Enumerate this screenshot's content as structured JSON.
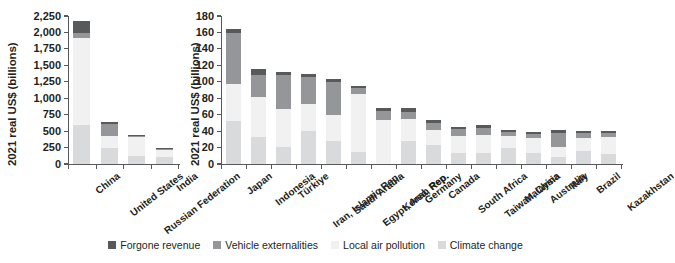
{
  "figure": {
    "background_color": "#ffffff",
    "text_color": "#231f20",
    "axis_color": "#58595b"
  },
  "legend": {
    "position": "bottom-center",
    "items": [
      {
        "key": "forgone",
        "label": "Forgone revenue",
        "color": "#58595b"
      },
      {
        "key": "vehicle",
        "label": "Vehicle externalities",
        "color": "#949699"
      },
      {
        "key": "localair",
        "label": "Local air pollution",
        "color": "#f1f1f1"
      },
      {
        "key": "climate",
        "label": "Climate change",
        "color": "#d9dadb"
      }
    ]
  },
  "chart_data": [
    {
      "id": "left-panel",
      "type": "bar",
      "stacked": true,
      "title": "",
      "xlabel": "",
      "ylabel": "2021 real US$ (billions)",
      "ylim": [
        0,
        2250
      ],
      "yticks": [
        0,
        250,
        500,
        750,
        1000,
        1250,
        1500,
        1750,
        2000,
        2250
      ],
      "ytick_labels": [
        "0",
        "250",
        "500",
        "750",
        "1,000",
        "1,250",
        "1,500",
        "1,750",
        "2,000",
        "2,250"
      ],
      "grid": false,
      "categories": [
        "China",
        "United States",
        "Russian Federation",
        "India"
      ],
      "series": [
        {
          "name": "Climate change",
          "key": "climate",
          "color": "#d9dadb",
          "values": [
            600,
            240,
            120,
            110
          ]
        },
        {
          "name": "Local air pollution",
          "key": "localair",
          "color": "#f1f1f1",
          "values": [
            1310,
            180,
            285,
            110
          ]
        },
        {
          "name": "Vehicle externalities",
          "key": "vehicle",
          "color": "#949699",
          "values": [
            75,
            190,
            15,
            10
          ]
        },
        {
          "name": "Forgone revenue",
          "key": "forgone",
          "color": "#58595b",
          "values": [
            195,
            30,
            20,
            10
          ]
        }
      ],
      "totals": [
        2180,
        640,
        440,
        240
      ]
    },
    {
      "id": "right-panel",
      "type": "bar",
      "stacked": true,
      "title": "",
      "xlabel": "",
      "ylabel": "2021 real US$ (billions)",
      "ylim": [
        0,
        180
      ],
      "yticks": [
        0,
        20,
        40,
        60,
        80,
        100,
        120,
        140,
        160,
        180
      ],
      "ytick_labels": [
        "0",
        "20",
        "40",
        "60",
        "80",
        "100",
        "120",
        "140",
        "160",
        "180"
      ],
      "grid": false,
      "categories": [
        "Japan",
        "Indonesia",
        "Türkiye",
        "Iran, Islamic Rep.",
        "Saudi Arabia",
        "Egypt, Arab Rep.",
        "Korea, Rep.",
        "Germany",
        "Canada",
        "South Africa",
        "Taiwan, China",
        "Malaysia",
        "Australia",
        "Italy",
        "Brazil",
        "Kazakhstan"
      ],
      "series": [
        {
          "name": "Climate change",
          "key": "climate",
          "color": "#d9dadb",
          "values": [
            52,
            33,
            21,
            40,
            28,
            15,
            0,
            28,
            23,
            14,
            14,
            20,
            14,
            9,
            16,
            12
          ]
        },
        {
          "name": "Local air pollution",
          "key": "localair",
          "color": "#f1f1f1",
          "values": [
            45,
            48,
            46,
            33,
            32,
            70,
            54,
            27,
            18,
            20,
            21,
            14,
            18,
            12,
            16,
            21
          ]
        },
        {
          "name": "Vehicle externalities",
          "key": "vehicle",
          "color": "#949699",
          "values": [
            62,
            27,
            41,
            33,
            40,
            8,
            10,
            8,
            9,
            8,
            9,
            5,
            5,
            17,
            6,
            5
          ]
        },
        {
          "name": "Forgone revenue",
          "key": "forgone",
          "color": "#58595b",
          "values": [
            5,
            7,
            4,
            4,
            4,
            2,
            4,
            5,
            4,
            3,
            3,
            2,
            2,
            3,
            2,
            2
          ]
        }
      ],
      "totals": [
        164,
        115,
        112,
        110,
        104,
        95,
        68,
        68,
        54,
        45,
        47,
        41,
        39,
        41,
        40,
        40
      ]
    }
  ]
}
